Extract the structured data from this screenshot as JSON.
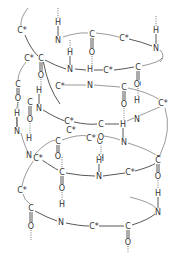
{
  "diagram": {
    "title": "",
    "atoms": [
      {
        "label": "C*",
        "x": 22,
        "y": 30
      },
      {
        "label": "H",
        "x": 58,
        "y": 22
      },
      {
        "label": "N",
        "x": 58,
        "y": 40
      },
      {
        "label": "C",
        "x": 92,
        "y": 34
      },
      {
        "label": "O",
        "x": 92,
        "y": 52
      },
      {
        "label": "C*",
        "x": 124,
        "y": 38
      },
      {
        "label": "H",
        "x": 156,
        "y": 30
      },
      {
        "label": "N",
        "x": 156,
        "y": 48
      },
      {
        "label": "C*",
        "x": 29,
        "y": 58
      },
      {
        "label": "C",
        "x": 41,
        "y": 58
      },
      {
        "label": "O",
        "x": 41,
        "y": 75
      },
      {
        "label": "H",
        "x": 70,
        "y": 52
      },
      {
        "label": "N",
        "x": 70,
        "y": 69
      },
      {
        "label": "H",
        "x": 90,
        "y": 69
      },
      {
        "label": "C*",
        "x": 108,
        "y": 70
      },
      {
        "label": "C",
        "x": 138,
        "y": 67
      },
      {
        "label": "O",
        "x": 138,
        "y": 84
      },
      {
        "label": "C",
        "x": 18,
        "y": 84
      },
      {
        "label": "O",
        "x": 18,
        "y": 98
      },
      {
        "label": "H",
        "x": 39,
        "y": 90
      },
      {
        "label": "N",
        "x": 39,
        "y": 108
      },
      {
        "label": "C",
        "x": 30,
        "y": 102
      },
      {
        "label": "O",
        "x": 30,
        "y": 119
      },
      {
        "label": "C*",
        "x": 60,
        "y": 86
      },
      {
        "label": "N",
        "x": 90,
        "y": 85
      },
      {
        "label": "C",
        "x": 124,
        "y": 87
      },
      {
        "label": "O",
        "x": 124,
        "y": 104
      },
      {
        "label": "O",
        "x": 137,
        "y": 84
      },
      {
        "label": "H",
        "x": 137,
        "y": 100
      },
      {
        "label": "C*",
        "x": 163,
        "y": 103
      },
      {
        "label": "N",
        "x": 137,
        "y": 119
      },
      {
        "label": "C*",
        "x": 69,
        "y": 121
      },
      {
        "label": "C",
        "x": 101,
        "y": 124
      },
      {
        "label": "H",
        "x": 123,
        "y": 124
      },
      {
        "label": "H",
        "x": 17,
        "y": 113
      },
      {
        "label": "N",
        "x": 17,
        "y": 131
      },
      {
        "label": "H",
        "x": 29,
        "y": 138
      },
      {
        "label": "C",
        "x": 58,
        "y": 141
      },
      {
        "label": "O",
        "x": 58,
        "y": 156
      },
      {
        "label": "C*",
        "x": 91,
        "y": 138
      },
      {
        "label": "O",
        "x": 100,
        "y": 141
      },
      {
        "label": "C*",
        "x": 71,
        "y": 130
      },
      {
        "label": "N",
        "x": 124,
        "y": 142
      },
      {
        "label": "O",
        "x": 101,
        "y": 137
      },
      {
        "label": "H",
        "x": 101,
        "y": 158
      },
      {
        "label": "N",
        "x": 29,
        "y": 155
      },
      {
        "label": "C*",
        "x": 38,
        "y": 158
      },
      {
        "label": "C",
        "x": 158,
        "y": 159
      },
      {
        "label": "C*",
        "x": 22,
        "y": 190
      },
      {
        "label": "C",
        "x": 62,
        "y": 172
      },
      {
        "label": "O",
        "x": 62,
        "y": 188
      },
      {
        "label": "H",
        "x": 62,
        "y": 204
      },
      {
        "label": "N",
        "x": 99,
        "y": 176
      },
      {
        "label": "H",
        "x": 99,
        "y": 160
      },
      {
        "label": "C*",
        "x": 130,
        "y": 172
      },
      {
        "label": "C",
        "x": 158,
        "y": 160
      },
      {
        "label": "O",
        "x": 158,
        "y": 176
      },
      {
        "label": "H",
        "x": 158,
        "y": 193
      },
      {
        "label": "N",
        "x": 158,
        "y": 212
      },
      {
        "label": "C",
        "x": 31,
        "y": 208
      },
      {
        "label": "O",
        "x": 31,
        "y": 226
      },
      {
        "label": "N",
        "x": 61,
        "y": 222
      },
      {
        "label": "C*",
        "x": 94,
        "y": 226
      },
      {
        "label": "C",
        "x": 128,
        "y": 226
      },
      {
        "label": "O",
        "x": 128,
        "y": 242
      }
    ]
  }
}
